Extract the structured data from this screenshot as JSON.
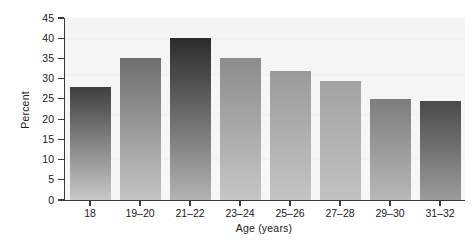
{
  "chart_data": {
    "type": "bar",
    "title": "",
    "xlabel": "Age (years)",
    "ylabel": "Percent",
    "categories": [
      "18",
      "19–20",
      "21–22",
      "23–24",
      "25–26",
      "27–28",
      "29–30",
      "31–32"
    ],
    "values": [
      28,
      35,
      40,
      35,
      32,
      29.5,
      25,
      24.5
    ],
    "ylim": [
      0,
      45
    ],
    "yticks": [
      0,
      5,
      10,
      15,
      20,
      25,
      30,
      35,
      40,
      45
    ],
    "ytick_labels": [
      "0",
      "5",
      "10",
      "15",
      "20",
      "25",
      "30",
      "35",
      "40",
      "45"
    ],
    "grid": false,
    "legend": "none",
    "bar_colors_top": [
      "#3f3f3f",
      "#6f6f6f",
      "#2b2b2b",
      "#8c8c8c",
      "#9a9a9a",
      "#a2a2a2",
      "#7d7d7d",
      "#4a4a4a"
    ],
    "bar_colors_bottom": [
      "#c9c9c9",
      "#c4c4c4",
      "#b3b3b3",
      "#c6c6c6",
      "#c4c4c4",
      "#c2c2c2",
      "#b8b8b8",
      "#9c9c9c"
    ],
    "plot_background": "#f5f5f5",
    "axis_color": "#3a3a3a"
  }
}
